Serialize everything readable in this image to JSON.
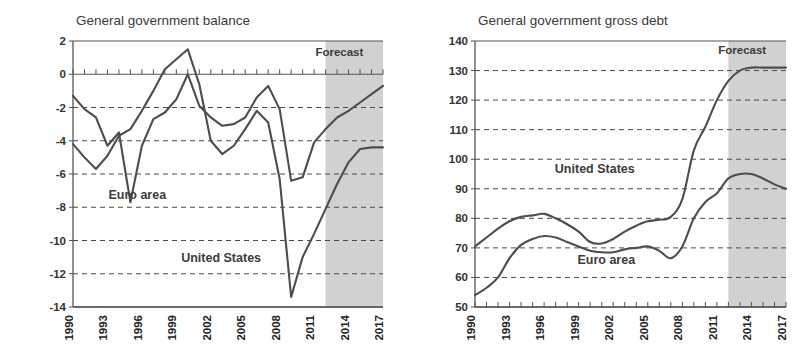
{
  "figure": {
    "background_color": "#ffffff",
    "line_color": "#4d4d4d",
    "forecast_band_color": "#c9c9c9",
    "grid_color": "#4a4a4a"
  },
  "chart_data": [
    {
      "type": "line",
      "id": "general-government-balance",
      "title": "General government balance",
      "xlabel": "",
      "ylabel": "",
      "xlim": [
        1990,
        2017
      ],
      "ylim": [
        -14,
        2
      ],
      "yticks": [
        2,
        0,
        -2,
        -4,
        -6,
        -8,
        -10,
        -12,
        -14
      ],
      "ytick_labels": [
        "2",
        "0",
        "-2",
        "-4",
        "-6",
        "-8",
        "-10",
        "-12",
        "-14"
      ],
      "xticks": [
        1990,
        1993,
        1996,
        1999,
        2002,
        2005,
        2008,
        2011,
        2014,
        2017
      ],
      "xtick_labels": [
        "1990",
        "1993",
        "1996",
        "1999",
        "2002",
        "2005",
        "2008",
        "2011",
        "2014",
        "2017"
      ],
      "grid": true,
      "grid_axis": "y",
      "legend_position": "inline-annotation",
      "annotations": [
        {
          "text": "Forecast",
          "x": 2013.2,
          "y": 1.1
        },
        {
          "text": "Euro area",
          "x": 1995.6,
          "y": -7.5
        },
        {
          "text": "United States",
          "x": 2002.9,
          "y": -11.3
        }
      ],
      "forecast_start": 2012.0,
      "forecast_end": 2017,
      "x": [
        1990,
        1991,
        1992,
        1993,
        1994,
        1995,
        1996,
        1997,
        1998,
        1999,
        2000,
        2001,
        2002,
        2003,
        2004,
        2005,
        2006,
        2007,
        2008,
        2009,
        2010,
        2011,
        2012,
        2013,
        2014,
        2015,
        2016,
        2017
      ],
      "series": [
        {
          "name": "Euro area",
          "values": [
            -1.3,
            -2.1,
            -2.6,
            -4.3,
            -3.5,
            -7.7,
            -4.3,
            -2.7,
            -2.3,
            -1.5,
            0.0,
            -1.9,
            -2.6,
            -3.1,
            -3.0,
            -2.6,
            -1.4,
            -0.7,
            -2.1,
            -6.4,
            -6.2,
            -4.1,
            -3.3,
            -2.6,
            -2.2,
            -1.7,
            -1.2,
            -0.7
          ]
        },
        {
          "name": "United States",
          "values": [
            -4.2,
            -5.0,
            -5.7,
            -4.9,
            -3.7,
            -3.3,
            -2.2,
            -1.0,
            0.3,
            0.9,
            1.5,
            -0.6,
            -4.0,
            -4.8,
            -4.3,
            -3.3,
            -2.2,
            -2.9,
            -6.3,
            -13.4,
            -11.0,
            -9.6,
            -8.1,
            -6.6,
            -5.3,
            -4.5,
            -4.4,
            -4.4
          ]
        }
      ]
    },
    {
      "type": "line",
      "id": "general-government-gross-debt",
      "title": "General government gross debt",
      "xlabel": "",
      "ylabel": "",
      "xlim": [
        1990,
        2017
      ],
      "ylim": [
        50,
        140
      ],
      "yticks": [
        140,
        130,
        120,
        110,
        100,
        90,
        80,
        70,
        60,
        50
      ],
      "ytick_labels": [
        "140",
        "130",
        "120",
        "110",
        "100",
        "90",
        "80",
        "70",
        "60",
        "50"
      ],
      "xticks": [
        1990,
        1993,
        1996,
        1999,
        2002,
        2005,
        2008,
        2011,
        2014,
        2017
      ],
      "xtick_labels": [
        "1990",
        "1993",
        "1996",
        "1999",
        "2002",
        "2005",
        "2008",
        "2011",
        "2014",
        "2017"
      ],
      "grid": true,
      "grid_axis": "y",
      "legend_position": "inline-annotation",
      "annotations": [
        {
          "text": "Forecast",
          "x": 2013.2,
          "y": 135.5
        },
        {
          "text": "United States",
          "x": 2000.4,
          "y": 95.5
        },
        {
          "text": "Euro area",
          "x": 2001.4,
          "y": 64.5
        }
      ],
      "forecast_start": 2012.0,
      "forecast_end": 2017,
      "x": [
        1990,
        1991,
        1992,
        1993,
        1994,
        1995,
        1996,
        1997,
        1998,
        1999,
        2000,
        2001,
        2002,
        2003,
        2004,
        2005,
        2006,
        2007,
        2008,
        2009,
        2010,
        2011,
        2012,
        2013,
        2014,
        2015,
        2016,
        2017
      ],
      "series": [
        {
          "name": "United States",
          "values": [
            70.5,
            73.5,
            76.5,
            79.0,
            80.5,
            81.0,
            81.5,
            80.0,
            78.0,
            75.5,
            72.0,
            71.5,
            73.0,
            75.5,
            77.5,
            79.0,
            79.5,
            80.5,
            86.5,
            103.0,
            111.0,
            120.0,
            126.5,
            130.0,
            131.0,
            131.0,
            131.0,
            131.0
          ]
        },
        {
          "name": "Euro area",
          "values": [
            54.0,
            56.5,
            60.0,
            66.5,
            71.0,
            73.0,
            74.0,
            73.5,
            72.0,
            70.5,
            69.0,
            68.5,
            68.5,
            69.5,
            70.0,
            70.5,
            69.0,
            66.5,
            70.5,
            80.0,
            85.5,
            88.5,
            93.5,
            95.0,
            95.0,
            93.5,
            91.5,
            90.0
          ]
        }
      ]
    }
  ]
}
